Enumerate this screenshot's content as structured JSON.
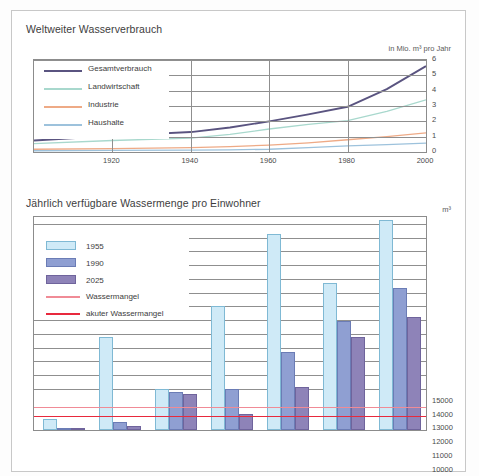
{
  "figure": {
    "background": "#ffffff",
    "border_color": "#c8c8c8"
  },
  "chart_data": [
    {
      "id": "weltweiter-wasserverbrauch",
      "type": "line",
      "title": "Weltweiter Wasserverbrauch",
      "unit_label": "in Mio. m³ pro Jahr",
      "xlabel": "",
      "ylabel": "",
      "xlim": [
        1900,
        2000
      ],
      "ylim": [
        0,
        6
      ],
      "yticks": [
        "0",
        "1",
        "2",
        "3",
        "4",
        "5",
        "6"
      ],
      "ytick_values": [
        0,
        1,
        2,
        3,
        4,
        5,
        6
      ],
      "xticks": [
        "1920",
        "1940",
        "1960",
        "1980",
        "2000"
      ],
      "xtick_values": [
        1920,
        1940,
        1960,
        1980,
        2000
      ],
      "grid": true,
      "legend_position": "upper-left-inside",
      "x": [
        1900,
        1920,
        1940,
        1950,
        1960,
        1970,
        1980,
        1990,
        2000
      ],
      "series": [
        {
          "name": "Gesamtverbrauch",
          "color": "#5a5480",
          "values": [
            0.75,
            1.05,
            1.3,
            1.6,
            2.0,
            2.45,
            2.95,
            4.1,
            5.6
          ]
        },
        {
          "name": "Landwirtschaft",
          "color": "#a8d8cd",
          "values": [
            0.55,
            0.75,
            0.9,
            1.15,
            1.5,
            1.8,
            2.05,
            2.65,
            3.4
          ]
        },
        {
          "name": "Industrie",
          "color": "#eeaa86",
          "values": [
            0.18,
            0.22,
            0.28,
            0.35,
            0.45,
            0.6,
            0.8,
            1.0,
            1.25
          ]
        },
        {
          "name": "Haushalte",
          "color": "#9dc2dc",
          "values": [
            0.08,
            0.1,
            0.12,
            0.14,
            0.18,
            0.28,
            0.4,
            0.48,
            0.58
          ]
        }
      ]
    },
    {
      "id": "jaehrlich-verfuegbare-wassermenge",
      "type": "bar",
      "title": "Jährlich verfügbare Wassermenge pro Einwohner",
      "unit_label": "m³",
      "xlabel": "",
      "ylabel": "",
      "ylim": [
        0,
        15500
      ],
      "yticks": [
        "15000",
        "14000",
        "13000",
        "12000",
        "11000",
        "10000",
        "9000",
        "8000",
        "7000",
        "6000",
        "5000",
        "4000",
        "3000",
        "1000",
        "0"
      ],
      "ytick_values": [
        15000,
        14000,
        13000,
        12000,
        11000,
        10000,
        9000,
        8000,
        7000,
        6000,
        5000,
        4000,
        3000,
        1000,
        0
      ],
      "grid": true,
      "legend_position": "upper-left-inside",
      "categories": [
        "Kuwait",
        "Vereinigte Arab. Emirate",
        "Deutschland",
        "Tansania",
        "Philippinen",
        "Schweiz",
        "USA"
      ],
      "series": [
        {
          "name": "1955",
          "color": "#cfeaf7",
          "border": "#7fb9d4",
          "values": [
            800,
            6800,
            3000,
            9000,
            14300,
            10700,
            15300
          ]
        },
        {
          "name": "1990",
          "color": "#8f9fd2",
          "border": "#6b7cb5",
          "values": [
            120,
            600,
            2800,
            3000,
            5700,
            7900,
            10300
          ]
        },
        {
          "name": "2025",
          "color": "#8e83b8",
          "border": "#6f649c",
          "values": [
            70,
            280,
            2600,
            1200,
            3100,
            6800,
            8200
          ]
        }
      ],
      "threshold_lines": [
        {
          "name": "Wassermangel",
          "value": 1700,
          "color": "#f08b96",
          "tick_label": "1 700"
        },
        {
          "name": "akuter Wassermangel",
          "value": 1000,
          "color": "#e8293d",
          "tick_label": "1000"
        }
      ]
    }
  ]
}
